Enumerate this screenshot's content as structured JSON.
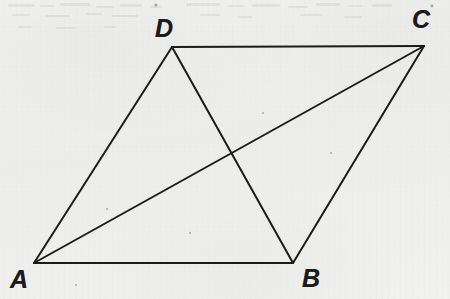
{
  "figure": {
    "kind": "geometry-diagram",
    "shape_name": "parallelogram",
    "background_color": "#f2f2f0",
    "ink_color": "#1b1b1b",
    "stroke_width": 2,
    "canvas": {
      "width": 450,
      "height": 299
    },
    "vertices": [
      {
        "id": "A",
        "label": "A",
        "x": 34,
        "y": 263,
        "label_x": 10,
        "label_y": 267
      },
      {
        "id": "B",
        "label": "B",
        "x": 293,
        "y": 263,
        "label_x": 302,
        "label_y": 266
      },
      {
        "id": "C",
        "label": "C",
        "x": 424,
        "y": 46,
        "label_x": 412,
        "label_y": 7
      },
      {
        "id": "D",
        "label": "D",
        "x": 172,
        "y": 47,
        "label_x": 155,
        "label_y": 16
      }
    ],
    "sides": [
      {
        "name": "AB",
        "from": "A",
        "to": "B"
      },
      {
        "name": "BC",
        "from": "B",
        "to": "C"
      },
      {
        "name": "CD",
        "from": "C",
        "to": "D"
      },
      {
        "name": "DA",
        "from": "D",
        "to": "A"
      }
    ],
    "diagonals": [
      {
        "name": "AC",
        "from": "A",
        "to": "C"
      },
      {
        "name": "DB",
        "from": "D",
        "to": "B"
      }
    ],
    "intersection": {
      "name": "diagonal-intersection",
      "x": 232,
      "y": 155
    },
    "specks": [
      {
        "x": 106,
        "y": 208,
        "size": 2
      },
      {
        "x": 330,
        "y": 152,
        "size": 2
      },
      {
        "x": 75,
        "y": 284,
        "size": 2
      },
      {
        "x": 262,
        "y": 112,
        "size": 2
      },
      {
        "x": 189,
        "y": 232,
        "size": 2
      }
    ]
  }
}
